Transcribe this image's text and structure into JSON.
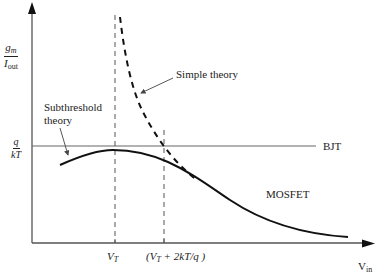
{
  "diagram": {
    "y_axis_label": {
      "numerator": "g",
      "numerator_sub": "m",
      "denominator": "I",
      "denominator_sub": "out"
    },
    "x_axis_label": {
      "main": "V",
      "sub": "in"
    },
    "reference_level_label": {
      "numerator": "q",
      "denominator": "kT"
    },
    "x_ticks": [
      {
        "main": "V",
        "sub": "T",
        "suffix": ""
      },
      {
        "prefix": "(V",
        "sub": "T",
        "suffix": " + 2kT/q )"
      }
    ],
    "curve_labels": {
      "bjt": "BJT",
      "mosfet": "MOSFET",
      "simple_theory": "Simple theory",
      "subthreshold_line1": "Subthreshold",
      "subthreshold_line2": "theory"
    },
    "colors": {
      "axis": "#555555",
      "curve": "#111111",
      "bjt_line": "#666666",
      "dashed_guides": "#555555"
    }
  }
}
